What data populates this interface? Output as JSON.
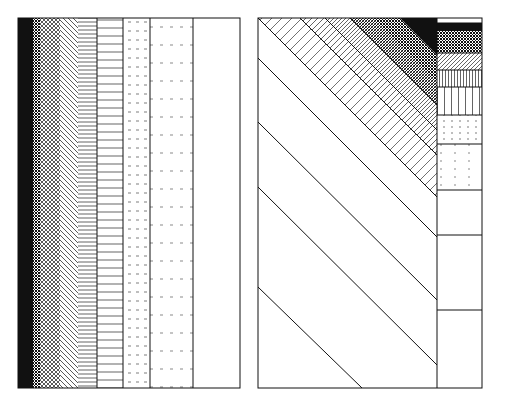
{
  "figure": {
    "ink_color": "#111111",
    "paper_color": "#ffffff"
  },
  "left_panel": {
    "label": "vertical-gradient-panel",
    "bands": [
      {
        "name": "solid-black",
        "tone": "black"
      },
      {
        "name": "dense-crosshatch",
        "tone": "very-dark"
      },
      {
        "name": "crosshatch",
        "tone": "dark"
      },
      {
        "name": "diagonal-hatch",
        "tone": "mid-dark"
      },
      {
        "name": "fine-horizontal",
        "tone": "mid"
      },
      {
        "name": "horizontal-lines",
        "tone": "mid-light"
      },
      {
        "name": "dashed-lines",
        "tone": "light"
      },
      {
        "name": "sparse-dashed",
        "tone": "very-light"
      },
      {
        "name": "blank",
        "tone": "white"
      }
    ]
  },
  "right_panel": {
    "label": "diagonal-gradient-panel",
    "diagonal_bands": 9,
    "strip_rows": [
      {
        "name": "blank-top",
        "tone": "white"
      },
      {
        "name": "solid-black",
        "tone": "black"
      },
      {
        "name": "crosshatch",
        "tone": "very-dark"
      },
      {
        "name": "diagonal-hatch",
        "tone": "dark"
      },
      {
        "name": "dense-vertical",
        "tone": "mid-dark"
      },
      {
        "name": "vertical-lines",
        "tone": "mid"
      },
      {
        "name": "dotted-vertical",
        "tone": "light"
      },
      {
        "name": "sparse-dotted",
        "tone": "very-light"
      },
      {
        "name": "blank-1",
        "tone": "white"
      },
      {
        "name": "blank-2",
        "tone": "white"
      },
      {
        "name": "blank-3",
        "tone": "white"
      }
    ]
  }
}
